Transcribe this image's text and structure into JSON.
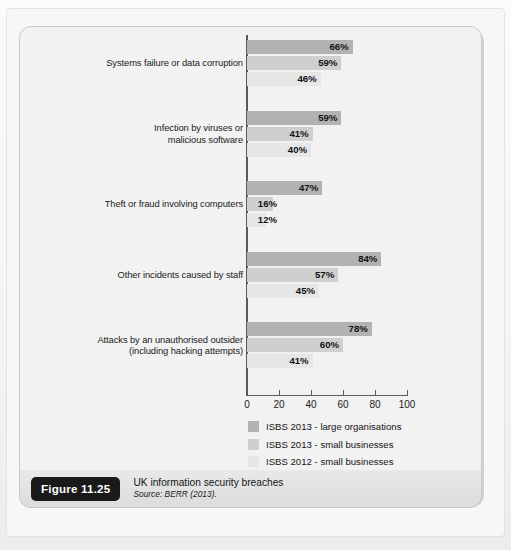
{
  "figure": {
    "badge": "Figure 11.25",
    "title": "UK information security breaches",
    "source": "Source: BERR (2013)."
  },
  "chart_data": {
    "type": "bar",
    "orientation": "horizontal",
    "title": "UK information security breaches",
    "xlabel": "",
    "ylabel": "",
    "xlim": [
      0,
      100
    ],
    "xticks": [
      0,
      20,
      40,
      60,
      80,
      100
    ],
    "grid": false,
    "legend_position": "bottom-right",
    "value_suffix": "%",
    "categories": [
      "Systems failure or data corruption",
      "Infection by viruses or\nmalicious software",
      "Theft or fraud involving computers",
      "Other incidents caused by staff",
      "Attacks by an unauthorised outsider\n(including hacking attempts)"
    ],
    "series": [
      {
        "name": "ISBS 2013 - large organisations",
        "color": "#b2b2b2",
        "values": [
          66,
          59,
          47,
          84,
          78
        ],
        "labels": [
          "66%",
          "59%",
          "47%",
          "84%",
          "78%"
        ]
      },
      {
        "name": "ISBS 2013 - small businesses",
        "color": "#cfcfcf",
        "values": [
          59,
          41,
          16,
          57,
          60
        ],
        "labels": [
          "59%",
          "41%",
          "16%",
          "57%",
          "60%"
        ]
      },
      {
        "name": "ISBS 2012 - small businesses",
        "color": "#e6e6e6",
        "values": [
          46,
          40,
          12,
          45,
          41
        ],
        "labels": [
          "46%",
          "40%",
          "12%",
          "45%",
          "41%"
        ]
      }
    ]
  }
}
